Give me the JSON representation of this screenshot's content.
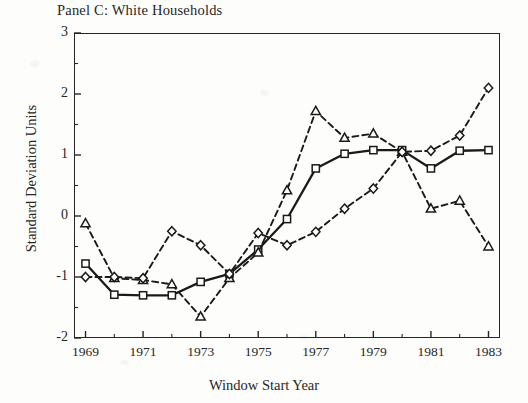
{
  "chart_data": {
    "type": "line",
    "title": "Panel C: White Households",
    "xlabel": "Window Start Year",
    "ylabel": "Standard Deviation Units",
    "xlim": [
      1968.6,
      1983.4
    ],
    "ylim": [
      -2,
      3
    ],
    "grid": false,
    "legend": "none",
    "yticks": [
      3,
      2,
      1,
      0,
      -1,
      -2
    ],
    "ytick_labels": [
      "3",
      "2",
      "1",
      "0",
      "-1",
      "-2"
    ],
    "xticks": [
      1969,
      1971,
      1973,
      1975,
      1977,
      1979,
      1981,
      1983
    ],
    "xtick_labels": [
      "1969",
      "1971",
      "1973",
      "1975",
      "1977",
      "1979",
      "1981",
      "1983"
    ],
    "x": [
      1969,
      1970,
      1971,
      1972,
      1973,
      1974,
      1975,
      1976,
      1977,
      1978,
      1979,
      1980,
      1981,
      1982,
      1983
    ],
    "series": [
      {
        "name": "series-squares",
        "marker": "square",
        "linestyle": "solid",
        "color": "#1a1a1a",
        "values": [
          -0.78,
          -1.29,
          -1.3,
          -1.3,
          -1.08,
          -0.95,
          -0.55,
          -0.05,
          0.78,
          1.02,
          1.08,
          1.08,
          0.78,
          1.07,
          1.08
        ]
      },
      {
        "name": "series-triangles",
        "marker": "triangle",
        "linestyle": "dashed",
        "color": "#1a1a1a",
        "values": [
          -0.12,
          -1.02,
          -1.05,
          -1.12,
          -1.65,
          -1.02,
          -0.6,
          0.42,
          1.72,
          1.28,
          1.35,
          1.05,
          0.12,
          0.25,
          -0.5
        ]
      },
      {
        "name": "series-diamonds",
        "marker": "diamond",
        "linestyle": "dashed",
        "color": "#1a1a1a",
        "values": [
          -1.0,
          -1.0,
          -1.02,
          -0.25,
          -0.48,
          -0.95,
          -0.28,
          -0.48,
          -0.26,
          0.12,
          0.45,
          1.05,
          1.07,
          1.32,
          2.1
        ]
      }
    ]
  }
}
